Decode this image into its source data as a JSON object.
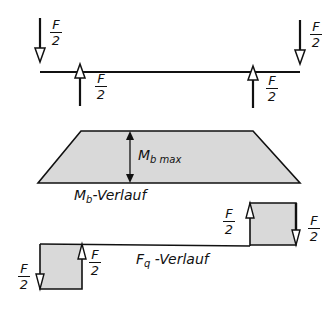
{
  "diagram": {
    "beam_loads": {
      "load_label_numerator": "F",
      "load_label_denominator": "2",
      "loads": [
        {
          "position": "left-end",
          "direction": "down",
          "label": "F/2"
        },
        {
          "position": "left-support",
          "direction": "up",
          "label": "F/2"
        },
        {
          "position": "right-support",
          "direction": "up",
          "label": "F/2"
        },
        {
          "position": "right-end",
          "direction": "down",
          "label": "F/2"
        }
      ]
    },
    "moment_diagram": {
      "max_label_main": "M",
      "max_label_sub": "b max",
      "title_main": "M",
      "title_sub": "b",
      "title_suffix": "-Verlauf",
      "fill_color": "#d9d9d9"
    },
    "shear_diagram": {
      "title_main": "F",
      "title_sub": "q",
      "title_suffix": " -Verlauf",
      "fill_color": "#d9d9d9",
      "labels": [
        "F/2",
        "F/2",
        "F/2",
        "F/2"
      ]
    },
    "line_color": "#111111"
  }
}
